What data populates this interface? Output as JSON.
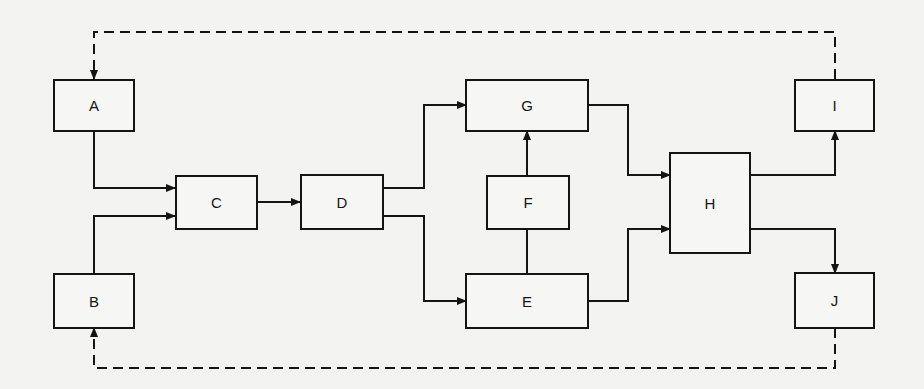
{
  "diagram": {
    "type": "block-diagram",
    "nodes": {
      "A": {
        "label": "A"
      },
      "B": {
        "label": "B"
      },
      "C": {
        "label": "C"
      },
      "D": {
        "label": "D"
      },
      "E": {
        "label": "E"
      },
      "F": {
        "label": "F"
      },
      "G": {
        "label": "G"
      },
      "H": {
        "label": "H"
      },
      "I": {
        "label": "I"
      },
      "J": {
        "label": "J"
      }
    },
    "edges": [
      {
        "from": "A",
        "to": "C",
        "style": "solid"
      },
      {
        "from": "B",
        "to": "C",
        "style": "solid"
      },
      {
        "from": "C",
        "to": "D",
        "style": "solid"
      },
      {
        "from": "D",
        "to": "G",
        "style": "solid"
      },
      {
        "from": "D",
        "to": "E",
        "style": "solid"
      },
      {
        "from": "E",
        "to": "F",
        "style": "solid",
        "arrow": false
      },
      {
        "from": "F",
        "to": "G",
        "style": "solid"
      },
      {
        "from": "G",
        "to": "H",
        "style": "solid"
      },
      {
        "from": "E",
        "to": "H",
        "style": "solid"
      },
      {
        "from": "H",
        "to": "I",
        "style": "solid"
      },
      {
        "from": "H",
        "to": "J",
        "style": "solid"
      },
      {
        "from": "I",
        "to": "A",
        "style": "dashed"
      },
      {
        "from": "J",
        "to": "B",
        "style": "dashed"
      }
    ],
    "colors": {
      "line": "#141414",
      "background": "#f3f3f1"
    }
  }
}
